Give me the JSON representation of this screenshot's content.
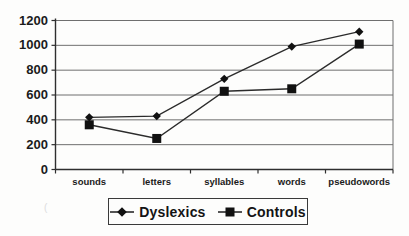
{
  "chart_data": {
    "type": "line",
    "categories": [
      "sounds",
      "letters",
      "syllables",
      "words",
      "pseudowords"
    ],
    "series": [
      {
        "name": "Dyslexics",
        "marker": "diamond",
        "values": [
          420,
          430,
          730,
          990,
          1110
        ]
      },
      {
        "name": "Controls",
        "marker": "square",
        "values": [
          360,
          250,
          630,
          650,
          1010
        ]
      }
    ],
    "title": "",
    "xlabel": "",
    "ylabel": "",
    "ylim": [
      0,
      1200
    ],
    "yticks": [
      0,
      200,
      400,
      600,
      800,
      1000,
      1200
    ],
    "grid": "horizontal",
    "legend_position": "bottom"
  },
  "legend": {
    "items": [
      {
        "label": "Dyslexics",
        "marker": "diamond"
      },
      {
        "label": "Controls",
        "marker": "square"
      }
    ]
  },
  "colors": {
    "background": "#fdfdfc",
    "grid": "#6f6f6f",
    "axis": "#2f2f2f",
    "line": "#2b2b2b",
    "marker": "#111111",
    "text": "#1b1b1b",
    "legend_border": "#3a3a3a"
  },
  "artifact": "("
}
